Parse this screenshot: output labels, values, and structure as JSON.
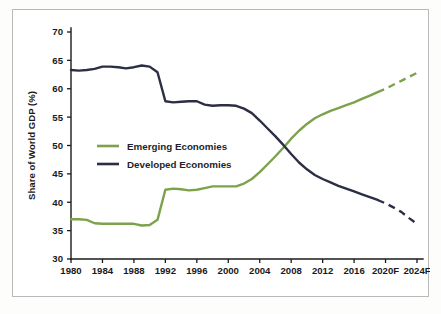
{
  "chart_data": {
    "type": "line",
    "title": "",
    "subtitle": "",
    "xlabel": "",
    "ylabel": "Share of World GDP (%)",
    "ylim": [
      30,
      70
    ],
    "xlim": [
      1980,
      2024
    ],
    "grid": false,
    "legend_position": "inside-upper-left",
    "y_ticks": [
      "30",
      "35",
      "40",
      "45",
      "50",
      "55",
      "60",
      "65",
      "70"
    ],
    "y_tick_values": [
      30,
      35,
      40,
      45,
      50,
      55,
      60,
      65,
      70
    ],
    "x_ticks": [
      "1980",
      "1984",
      "1988",
      "1992",
      "1996",
      "2000",
      "2004",
      "2008",
      "2012",
      "2016",
      "2020F",
      "2024F"
    ],
    "x_tick_values": [
      1980,
      1984,
      1988,
      1992,
      1996,
      2000,
      2004,
      2008,
      2012,
      2016,
      2020,
      2024
    ],
    "forecast_start_year": 2019,
    "x": [
      1980,
      1981,
      1982,
      1983,
      1984,
      1985,
      1986,
      1987,
      1988,
      1989,
      1990,
      1991,
      1992,
      1993,
      1994,
      1995,
      1996,
      1997,
      1998,
      1999,
      2000,
      2001,
      2002,
      2003,
      2004,
      2005,
      2006,
      2007,
      2008,
      2009,
      2010,
      2011,
      2012,
      2013,
      2014,
      2015,
      2016,
      2017,
      2018,
      2019,
      2020,
      2021,
      2022,
      2023,
      2024
    ],
    "series": [
      {
        "name": "Emerging Economies",
        "color": "#7CA24C",
        "values": [
          37.0,
          37.0,
          36.9,
          36.3,
          36.2,
          36.2,
          36.2,
          36.2,
          36.2,
          35.9,
          36.0,
          36.9,
          42.2,
          42.4,
          42.3,
          42.1,
          42.2,
          42.5,
          42.8,
          42.8,
          42.8,
          42.8,
          43.3,
          44.1,
          45.3,
          46.7,
          48.1,
          49.6,
          51.2,
          52.6,
          53.8,
          54.8,
          55.5,
          56.1,
          56.6,
          57.1,
          57.6,
          58.2,
          58.8,
          59.4,
          60.0,
          60.7,
          61.4,
          62.1,
          62.8
        ],
        "forecast_from": 2019
      },
      {
        "name": "Developed Economies",
        "color": "#2B2E45",
        "values": [
          63.3,
          63.2,
          63.3,
          63.5,
          63.9,
          63.9,
          63.8,
          63.6,
          63.8,
          64.1,
          63.9,
          62.9,
          57.8,
          57.6,
          57.7,
          57.8,
          57.8,
          57.2,
          57.0,
          57.1,
          57.1,
          57.0,
          56.5,
          55.7,
          54.4,
          53.0,
          51.6,
          50.1,
          48.5,
          47.0,
          45.8,
          44.8,
          44.1,
          43.5,
          42.9,
          42.4,
          41.9,
          41.4,
          40.9,
          40.4,
          39.8,
          39.1,
          38.3,
          37.2,
          36.2
        ],
        "forecast_from": 2019
      }
    ]
  },
  "legend": {
    "items": [
      {
        "label": "Emerging Economies",
        "color": "#7CA24C"
      },
      {
        "label": "Developed Economies",
        "color": "#2B2E45"
      }
    ]
  },
  "axes": {
    "y_title": "Share of World GDP (%)"
  },
  "colors": {
    "emerging": "#7CA24C",
    "developed": "#2B2E45",
    "axis": "#1a1a1a",
    "frame": "#b9b9b9",
    "background": "#ffffff",
    "page_background": "#fdfdfc"
  }
}
